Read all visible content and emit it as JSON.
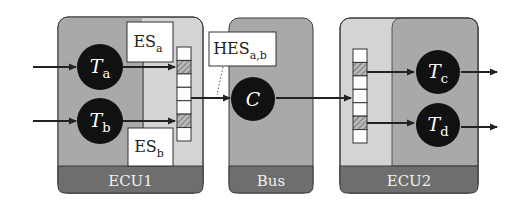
{
  "colors": {
    "background": "#ffffff",
    "box_dark": "#a9a9a9",
    "box_light": "#d4d4d4",
    "footer": "#6e6e6e",
    "border": "#3a3a3a",
    "task_fill": "#111111",
    "task_text": "#ffffff",
    "queue_empty": "#ffffff",
    "queue_hatched": "#8c8c8c",
    "label_box": "#ffffff"
  },
  "nodes": {
    "ecu1": {
      "label": "ECU1"
    },
    "bus": {
      "label": "Bus"
    },
    "ecu2": {
      "label": "ECU2"
    }
  },
  "tasks": {
    "ta": {
      "main": "T",
      "sub": "a"
    },
    "tb": {
      "main": "T",
      "sub": "b"
    },
    "c": {
      "main": "C",
      "sub": ""
    },
    "tc": {
      "main": "T",
      "sub": "c"
    },
    "td": {
      "main": "T",
      "sub": "d"
    }
  },
  "labels": {
    "es_a": {
      "main": "ES",
      "sub": "a"
    },
    "es_b": {
      "main": "ES",
      "sub": "b"
    },
    "hes": {
      "main": "HES",
      "sub": "a,b"
    }
  },
  "queues": {
    "ecu1_out": {
      "cells": 7,
      "hatched": [
        1,
        5
      ]
    },
    "ecu2_in": {
      "cells": 7,
      "hatched": [
        1,
        5
      ]
    }
  }
}
